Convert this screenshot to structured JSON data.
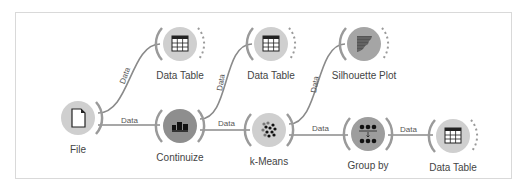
{
  "canvas": {
    "nodes": [
      {
        "id": "file",
        "label": "File",
        "icon": "file-icon"
      },
      {
        "id": "data-table-1",
        "label": "Data Table",
        "icon": "table-icon"
      },
      {
        "id": "continuize",
        "label": "Continuize",
        "icon": "continuize-icon"
      },
      {
        "id": "data-table-2",
        "label": "Data Table",
        "icon": "table-icon"
      },
      {
        "id": "k-means",
        "label": "k-Means",
        "icon": "scatter-clusters-icon"
      },
      {
        "id": "silhouette-plot",
        "label": "Silhouette Plot",
        "icon": "silhouette-icon"
      },
      {
        "id": "group-by",
        "label": "Group by",
        "icon": "group-by-icon"
      },
      {
        "id": "data-table-3",
        "label": "Data Table",
        "icon": "table-icon"
      }
    ],
    "links": [
      {
        "from": "file",
        "to": "data-table-1",
        "label": "Data"
      },
      {
        "from": "file",
        "to": "continuize",
        "label": "Data"
      },
      {
        "from": "continuize",
        "to": "data-table-2",
        "label": "Data"
      },
      {
        "from": "continuize",
        "to": "k-means",
        "label": "Data"
      },
      {
        "from": "k-means",
        "to": "silhouette-plot",
        "label": "Data"
      },
      {
        "from": "k-means",
        "to": "group-by",
        "label": "Data"
      },
      {
        "from": "group-by",
        "to": "data-table-3",
        "label": "Data"
      }
    ]
  },
  "colors": {
    "link": "#8a8a8a",
    "node": "#cfcfcf",
    "node_dark": "#8e8e8e",
    "ring": "#9a9a9a"
  }
}
